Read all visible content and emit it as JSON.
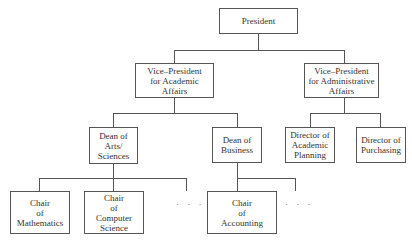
{
  "diagram": {
    "type": "organizational-chart",
    "nodes": {
      "president": {
        "lines": [
          "President"
        ]
      },
      "vp_academic": {
        "lines": [
          "Vice–President",
          "for Academic",
          "Affairs"
        ]
      },
      "vp_admin": {
        "lines": [
          "Vice–President",
          "for Administrative",
          "Affairs"
        ]
      },
      "dean_arts": {
        "lines": [
          "Dean of",
          "Arts/",
          "Sciences"
        ]
      },
      "dean_business": {
        "lines": [
          "Dean of",
          "Business"
        ]
      },
      "dir_academic_planning": {
        "lines": [
          "Director of",
          "Academic",
          "Planning"
        ]
      },
      "dir_purchasing": {
        "lines": [
          "Director of",
          "Purchasing"
        ]
      },
      "chair_math": {
        "lines": [
          "Chair",
          "of",
          "Mathematics"
        ]
      },
      "chair_cs": {
        "lines": [
          "Chair",
          "of",
          "Computer",
          "Science"
        ]
      },
      "chair_accounting": {
        "lines": [
          "Chair",
          "of",
          "Accounting"
        ]
      }
    },
    "ellipsis": "· · ·",
    "edges": [
      [
        "president",
        "vp_academic"
      ],
      [
        "president",
        "vp_admin"
      ],
      [
        "vp_academic",
        "dean_arts"
      ],
      [
        "vp_academic",
        "dean_business"
      ],
      [
        "vp_admin",
        "dir_academic_planning"
      ],
      [
        "vp_admin",
        "dir_purchasing"
      ],
      [
        "dean_arts",
        "chair_math"
      ],
      [
        "dean_arts",
        "chair_cs"
      ],
      [
        "dean_arts",
        "more_arts_chairs"
      ],
      [
        "dean_business",
        "chair_accounting"
      ],
      [
        "dean_business",
        "more_business_chairs"
      ]
    ]
  }
}
